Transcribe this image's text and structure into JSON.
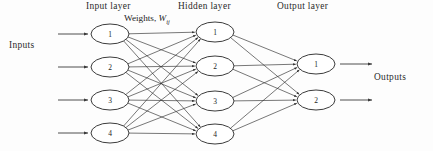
{
  "diagram": {
    "background_color": "#fdfdfd",
    "line_color": "#2e2e2e",
    "node_fill": "#ffffff",
    "node_stroke": "#262626",
    "text_color": "#2b2b2b"
  },
  "captions": {
    "input_layer": "Input layer",
    "hidden_layer": "Hidden layer",
    "output_layer": "Output layer",
    "inputs": "Inputs",
    "outputs": "Outputs",
    "weights_prefix": "Weights, ",
    "weights_symbol": "W",
    "weights_subscript": "ij"
  },
  "layers": [
    {
      "id": "input",
      "name": "Input layer",
      "cx": 110,
      "rx": 19,
      "ry": 10,
      "nodes": [
        {
          "label": "1",
          "cy": 34
        },
        {
          "label": "2",
          "cy": 67
        },
        {
          "label": "3",
          "cy": 100
        },
        {
          "label": "4",
          "cy": 133
        }
      ]
    },
    {
      "id": "hidden",
      "name": "Hidden layer",
      "cx": 215,
      "rx": 19,
      "ry": 10,
      "nodes": [
        {
          "label": "1",
          "cy": 32
        },
        {
          "label": "2",
          "cy": 66
        },
        {
          "label": "3",
          "cy": 101
        },
        {
          "label": "4",
          "cy": 134
        }
      ]
    },
    {
      "id": "output",
      "name": "Output layer",
      "cx": 316,
      "rx": 19,
      "ry": 10,
      "nodes": [
        {
          "label": "1",
          "cy": 64
        },
        {
          "label": "2",
          "cy": 100
        }
      ]
    }
  ],
  "input_arrows": [
    {
      "x1": 58,
      "x2": 88,
      "y": 34
    },
    {
      "x1": 58,
      "x2": 88,
      "y": 67
    },
    {
      "x1": 58,
      "x2": 88,
      "y": 100
    },
    {
      "x1": 58,
      "x2": 88,
      "y": 133
    }
  ],
  "output_arrows": [
    {
      "x1": 340,
      "x2": 372,
      "y": 64
    },
    {
      "x1": 340,
      "x2": 372,
      "y": 100
    }
  ],
  "connections": {
    "input_to_hidden": "fully-connected",
    "hidden_to_output": "fully-connected",
    "input_to_hidden_count": 16,
    "hidden_to_output_count": 8
  }
}
